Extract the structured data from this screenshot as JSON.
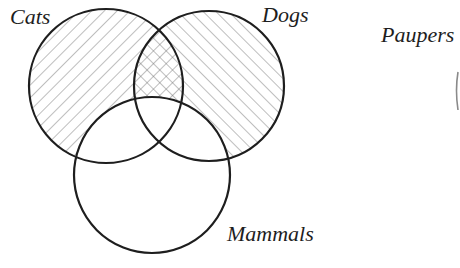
{
  "diagram": {
    "type": "venn",
    "colors": {
      "stroke": "#1e1e1e",
      "hatch": "#6f6f6f",
      "background": "#ffffff"
    },
    "sets": [
      {
        "id": "cats",
        "label": "Cats",
        "cx": 106,
        "cy": 86,
        "r": 77,
        "hatch": "backslash"
      },
      {
        "id": "dogs",
        "label": "Dogs",
        "cx": 209,
        "cy": 86,
        "r": 75,
        "hatch": "slash"
      },
      {
        "id": "mammals",
        "label": "Mammals",
        "cx": 152,
        "cy": 175,
        "r": 78,
        "hatch": "none"
      }
    ],
    "outside_label": {
      "id": "paupers",
      "label": "Paupers"
    },
    "shading_note": "Cats and Dogs regions outside Mammals are hatched; overlap of Cats and Dogs outside Mammals is cross-hatched; all of Mammals is unshaded."
  }
}
